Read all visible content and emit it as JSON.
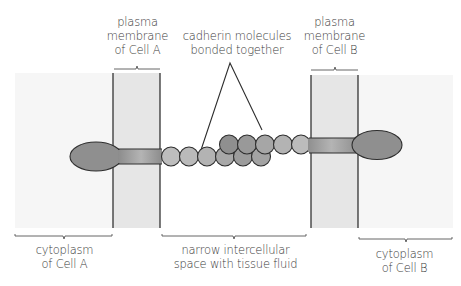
{
  "diagram": {
    "labels": {
      "membrane_a": [
        "plasma",
        "membrane",
        "of Cell A"
      ],
      "membrane_b": [
        "plasma",
        "membrane",
        "of Cell B"
      ],
      "cadherin": [
        "cadherin molecules",
        "bonded together"
      ],
      "cytoplasm_a": [
        "cytoplasm",
        "of Cell A"
      ],
      "intercellular": [
        "narrow intercellular",
        "space with tissue fluid"
      ],
      "cytoplasm_b": [
        "cytoplasm",
        "of Cell B"
      ]
    },
    "colors": {
      "cytoplasm_fill": "#f7f7f7",
      "membrane_fill": "#e6e6e6",
      "membrane_edge": "#333333",
      "molecule_dark": "#8a8a8a",
      "molecule_light": "#c8c8c8",
      "outline": "#2e2e2e",
      "text": "#3a3a3a"
    }
  }
}
